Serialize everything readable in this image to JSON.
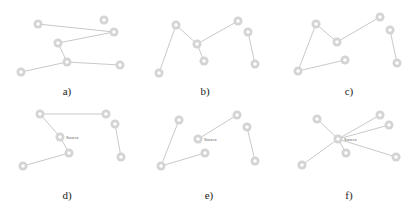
{
  "colors": {
    "edge": "#c9c9c9",
    "node": "#d4d4d4",
    "label": "#222222"
  },
  "panels": [
    {
      "id": "a",
      "label": "a)",
      "label_pos": [
        67,
        92
      ],
      "nodes": [
        [
          38,
          24
        ],
        [
          104,
          20
        ],
        [
          114,
          32
        ],
        [
          58,
          43
        ],
        [
          67,
          62
        ],
        [
          120,
          65
        ],
        [
          21,
          72
        ]
      ],
      "edges": [
        [
          0,
          2
        ],
        [
          2,
          3
        ],
        [
          3,
          4
        ],
        [
          4,
          5
        ],
        [
          4,
          6
        ]
      ],
      "node_label": null
    },
    {
      "id": "b",
      "label": "b)",
      "label_pos": [
        205,
        92
      ],
      "nodes": [
        [
          176,
          25
        ],
        [
          197,
          44
        ],
        [
          204,
          61
        ],
        [
          238,
          21
        ],
        [
          248,
          32
        ],
        [
          255,
          64
        ],
        [
          159,
          73
        ]
      ],
      "edges": [
        [
          6,
          0
        ],
        [
          0,
          1
        ],
        [
          1,
          2
        ],
        [
          1,
          3
        ],
        [
          4,
          5
        ]
      ],
      "node_label": null
    },
    {
      "id": "c",
      "label": "c)",
      "label_pos": [
        349,
        92
      ],
      "nodes": [
        [
          316,
          24
        ],
        [
          337,
          42
        ],
        [
          345,
          60
        ],
        [
          380,
          17
        ],
        [
          390,
          30
        ],
        [
          397,
          63
        ],
        [
          298,
          71
        ]
      ],
      "edges": [
        [
          6,
          0
        ],
        [
          0,
          1
        ],
        [
          1,
          3
        ],
        [
          4,
          5
        ],
        [
          6,
          2
        ]
      ],
      "node_label": null
    },
    {
      "id": "d",
      "label": "d)",
      "label_pos": [
        67,
        196
      ],
      "nodes": [
        [
          40,
          114
        ],
        [
          106,
          114
        ],
        [
          115,
          124
        ],
        [
          60,
          137
        ],
        [
          69,
          153
        ],
        [
          121,
          157
        ],
        [
          23,
          166
        ]
      ],
      "edges": [
        [
          0,
          1
        ],
        [
          0,
          3
        ],
        [
          3,
          4
        ],
        [
          4,
          6
        ],
        [
          2,
          5
        ]
      ],
      "node_label": {
        "text": "Source",
        "node": 3
      }
    },
    {
      "id": "e",
      "label": "e)",
      "label_pos": [
        209,
        196
      ],
      "nodes": [
        [
          179,
          120
        ],
        [
          237,
          115
        ],
        [
          247,
          127
        ],
        [
          198,
          139
        ],
        [
          205,
          153
        ],
        [
          255,
          161
        ],
        [
          161,
          166
        ]
      ],
      "edges": [
        [
          0,
          6
        ],
        [
          6,
          4
        ],
        [
          3,
          1
        ],
        [
          2,
          5
        ]
      ],
      "node_label": {
        "text": "Source",
        "node": 3
      }
    },
    {
      "id": "f",
      "label": "f)",
      "label_pos": [
        349,
        196
      ],
      "nodes": [
        [
          317,
          119
        ],
        [
          380,
          115
        ],
        [
          389,
          125
        ],
        [
          338,
          139
        ],
        [
          346,
          153
        ],
        [
          396,
          157
        ],
        [
          302,
          165
        ]
      ],
      "edges": [
        [
          3,
          0
        ],
        [
          3,
          1
        ],
        [
          3,
          2
        ],
        [
          3,
          4
        ],
        [
          3,
          5
        ],
        [
          3,
          6
        ]
      ],
      "node_label": {
        "text": "Source",
        "node": 3
      }
    }
  ]
}
